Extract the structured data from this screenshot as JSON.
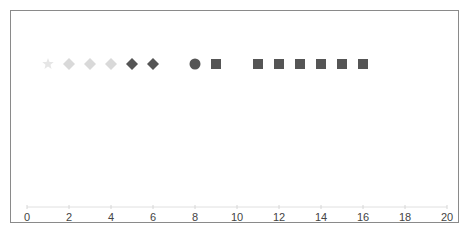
{
  "chart_data": {
    "type": "scatter",
    "title": "",
    "xlabel": "",
    "ylabel": "",
    "xlim": [
      0,
      20
    ],
    "grid": false,
    "legend": null,
    "x_ticks": [
      "0",
      "2",
      "4",
      "6",
      "8",
      "10",
      "12",
      "14",
      "16",
      "18",
      "20"
    ],
    "series": [
      {
        "name": "faint-star",
        "marker": "star",
        "color": "#e6e6e6",
        "x": [
          1
        ],
        "y": [
          1
        ]
      },
      {
        "name": "light-diamonds",
        "marker": "diamond",
        "color": "#d9d9d9",
        "x": [
          2,
          3,
          4
        ],
        "y": [
          1,
          1,
          1
        ]
      },
      {
        "name": "dark-diamonds",
        "marker": "diamond",
        "color": "#555555",
        "x": [
          5,
          6
        ],
        "y": [
          1,
          1
        ]
      },
      {
        "name": "circle",
        "marker": "circle",
        "color": "#555555",
        "x": [
          8
        ],
        "y": [
          1
        ]
      },
      {
        "name": "squares",
        "marker": "square",
        "color": "#555555",
        "x": [
          9,
          11,
          12,
          13,
          14,
          15,
          16
        ],
        "y": [
          1,
          1,
          1,
          1,
          1,
          1,
          1
        ]
      }
    ]
  }
}
